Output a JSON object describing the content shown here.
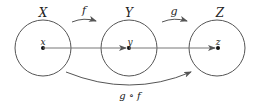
{
  "diagram": {
    "sets": [
      {
        "label": "X",
        "element": "x"
      },
      {
        "label": "Y",
        "element": "y"
      },
      {
        "label": "Z",
        "element": "z"
      }
    ],
    "maps": [
      {
        "label": "f",
        "from": "X",
        "to": "Y"
      },
      {
        "label": "g",
        "from": "Y",
        "to": "Z"
      },
      {
        "label": "g ∘ f",
        "from": "X",
        "to": "Z"
      }
    ],
    "colors": {
      "stroke": "#555555",
      "dot": "#111111",
      "text": "#222222"
    }
  }
}
